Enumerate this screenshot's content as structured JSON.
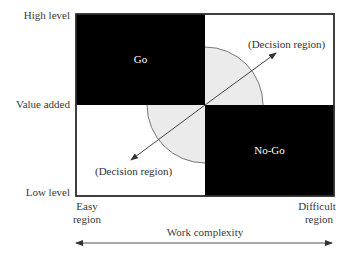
{
  "diagram": {
    "type": "decision-matrix",
    "y_axis": {
      "title": "Value added",
      "top_label": "High level",
      "bottom_label": "Low level"
    },
    "x_axis": {
      "title": "Work complexity",
      "left_label_line1": "Easy",
      "left_label_line2": "region",
      "right_label_line1": "Difficult",
      "right_label_line2": "region"
    },
    "quadrants": {
      "top_left": {
        "label": "Go",
        "fill": "#000000"
      },
      "top_right": {
        "label": "",
        "fill": "#ffffff"
      },
      "bottom_left": {
        "label": "",
        "fill": "#ffffff"
      },
      "bottom_right": {
        "label": "No-Go",
        "fill": "#000000"
      }
    },
    "decision_regions": {
      "upper_right": "(Decision region)",
      "lower_left": "(Decision region)",
      "fill": "#ebebeb",
      "stroke": "#777777"
    },
    "colors": {
      "border": "#333333",
      "arrow": "#444444"
    }
  }
}
